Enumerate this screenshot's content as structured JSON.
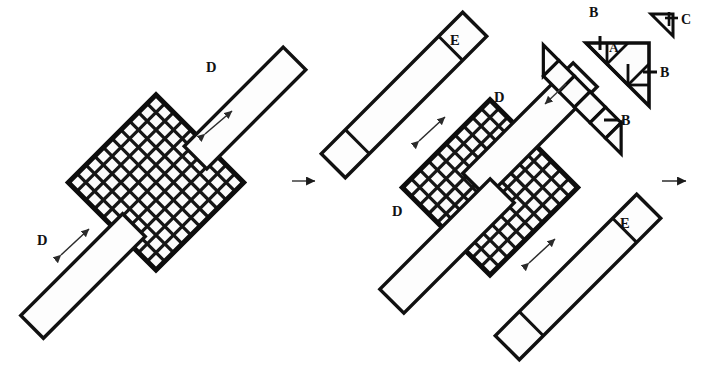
{
  "figure": {
    "type": "geometric-dissection-diagram",
    "background_color": "#ffffff",
    "stroke_color": "#141414",
    "cell_fill": "#fbfbfb",
    "arrow_color": "#3c3c3c"
  },
  "panels": [
    {
      "id": "panel-left",
      "labels": [
        {
          "text": "D",
          "x": 206,
          "y": 72
        },
        {
          "text": "D",
          "x": 42,
          "y": 240
        }
      ],
      "grid": {
        "cols": 10,
        "rows": 10,
        "label": ""
      }
    },
    {
      "id": "panel-right",
      "labels": [
        {
          "text": "E",
          "x": 456,
          "y": 41
        },
        {
          "text": "D",
          "x": 501,
          "y": 98
        },
        {
          "text": "D",
          "x": 398,
          "y": 212
        },
        {
          "text": "E",
          "x": 625,
          "y": 224
        }
      ],
      "grid": {
        "cols": 10,
        "rows": 10,
        "label": ""
      }
    }
  ],
  "pieces": [
    {
      "id": "piece-A",
      "text": "A",
      "x": 614,
      "y": 47
    },
    {
      "id": "tick-B-top",
      "text": "B",
      "x": 595,
      "y": 13
    },
    {
      "id": "tick-B-right",
      "text": "B",
      "x": 643,
      "y": 69
    },
    {
      "id": "piece-C",
      "text": "C",
      "x": 675,
      "y": 24
    },
    {
      "id": "tick-B-strip",
      "text": "B",
      "x": 622,
      "y": 117
    }
  ],
  "strip": {
    "id": "square-strip",
    "square_count": 4,
    "end_triangles": 2
  },
  "transition_arrows": [
    {
      "id": "arrow-1",
      "x": 290,
      "y": 180,
      "direction": "right"
    },
    {
      "id": "arrow-2",
      "x": 660,
      "y": 180,
      "direction": "right"
    }
  ],
  "dimension_arrows": [
    {
      "id": "dim-arrow-left-upper",
      "x1": 206,
      "y1": 133,
      "x2": 231,
      "y2": 112
    },
    {
      "id": "dim-arrow-left-lower",
      "x1": 62,
      "y1": 253,
      "x2": 88,
      "y2": 230
    },
    {
      "id": "dim-arrow-right-upper",
      "x1": 420,
      "y1": 140,
      "x2": 443,
      "y2": 118
    },
    {
      "id": "dim-arrow-right-lower",
      "x1": 530,
      "y1": 262,
      "x2": 553,
      "y2": 240
    }
  ],
  "placement_arrows": [
    {
      "id": "place-arrow-top",
      "x1": 568,
      "y1": 85,
      "x2": 547,
      "y2": 104
    },
    {
      "id": "place-arrow-mid",
      "x1": 562,
      "y1": 122,
      "x2": 542,
      "y2": 140
    },
    {
      "id": "place-arrow-bottom",
      "x1": 480,
      "y1": 330,
      "x2": 470,
      "y2": 344
    }
  ]
}
